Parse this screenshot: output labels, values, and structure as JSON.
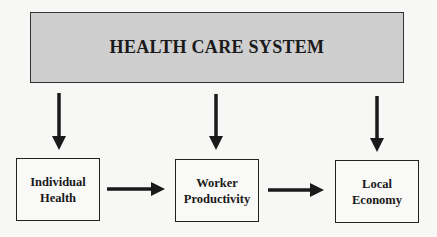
{
  "diagram": {
    "top": {
      "title": "HEALTH CARE SYSTEM"
    },
    "boxes": [
      {
        "line1": "Individual",
        "line2": "Health"
      },
      {
        "line1": "Worker",
        "line2": "Productivity"
      },
      {
        "line1": "Local",
        "line2": "Economy"
      }
    ],
    "edges": [
      {
        "from": "HEALTH CARE SYSTEM",
        "to": "Individual Health"
      },
      {
        "from": "HEALTH CARE SYSTEM",
        "to": "Worker Productivity"
      },
      {
        "from": "HEALTH CARE SYSTEM",
        "to": "Local Economy"
      },
      {
        "from": "Individual Health",
        "to": "Worker Productivity"
      },
      {
        "from": "Worker Productivity",
        "to": "Local Economy"
      }
    ],
    "colors": {
      "stroke": "#1a1a1a",
      "top_fill": "#e2e2e2",
      "background": "#f7f7f5"
    }
  }
}
